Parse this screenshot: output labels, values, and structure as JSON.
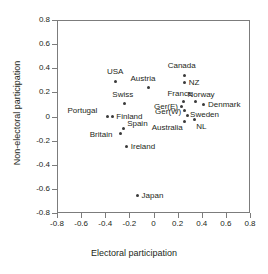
{
  "chart_data": {
    "type": "scatter",
    "title": "",
    "xlabel": "Electoral participation",
    "ylabel": "Non-electoral participation",
    "xlim": [
      -0.8,
      0.8
    ],
    "ylim": [
      -0.8,
      0.8
    ],
    "xticks": [
      "-0.8",
      "-0.6",
      "-0.4",
      "-0.2",
      "0",
      "0.2",
      "0.4",
      "0.6",
      "0.8"
    ],
    "xtick_values": [
      -0.8,
      -0.6,
      -0.4,
      -0.2,
      0,
      0.2,
      0.4,
      0.6,
      0.8
    ],
    "yticks": [
      "0.8",
      "0.6",
      "0.4",
      "0.2",
      "0",
      "-0.2",
      "-0.4",
      "-0.6",
      "-0.8"
    ],
    "ytick_values": [
      0.8,
      0.6,
      0.4,
      0.2,
      0,
      -0.2,
      -0.4,
      -0.6,
      -0.8
    ],
    "grid": false,
    "legend": false,
    "points": [
      {
        "label": "USA",
        "x": -0.32,
        "y": 0.3,
        "label_dx": -9,
        "label_dy": -13
      },
      {
        "label": "Canada",
        "x": 0.25,
        "y": 0.35,
        "label_dx": -17,
        "label_dy": -13
      },
      {
        "label": "NZ",
        "x": 0.25,
        "y": 0.29,
        "label_dx": 4,
        "label_dy": -4
      },
      {
        "label": "Austria",
        "x": -0.05,
        "y": 0.25,
        "label_dx": -18,
        "label_dy": -12
      },
      {
        "label": "Swiss",
        "x": -0.25,
        "y": 0.12,
        "label_dx": -12,
        "label_dy": -12
      },
      {
        "label": "France",
        "x": 0.24,
        "y": 0.13,
        "label_dx": -16,
        "label_dy": -12
      },
      {
        "label": "Norway",
        "x": 0.34,
        "y": 0.13,
        "label_dx": -8,
        "label_dy": -11
      },
      {
        "label": "Denmark",
        "x": 0.41,
        "y": 0.11,
        "label_dx": 4,
        "label_dy": -3
      },
      {
        "label": "Ger(E)",
        "x": 0.22,
        "y": 0.09,
        "label_dx": -27,
        "label_dy": -4
      },
      {
        "label": "Ger(W)",
        "x": 0.245,
        "y": 0.055,
        "label_dx": -29,
        "label_dy": -3
      },
      {
        "label": "Sweden",
        "x": 0.27,
        "y": 0.02,
        "label_dx": 3,
        "label_dy": -4
      },
      {
        "label": "Australia",
        "x": 0.25,
        "y": -0.03,
        "label_dx": -33,
        "label_dy": 3
      },
      {
        "label": "NL",
        "x": 0.33,
        "y": -0.02,
        "label_dx": 2,
        "label_dy": 3
      },
      {
        "label": "Portugal",
        "x": -0.39,
        "y": 0.01,
        "label_dx": -40,
        "label_dy": -9
      },
      {
        "label": "Finland",
        "x": -0.35,
        "y": 0.01,
        "label_dx": 4,
        "label_dy": -3
      },
      {
        "label": "Spain",
        "x": -0.26,
        "y": -0.09,
        "label_dx": 4,
        "label_dy": -8
      },
      {
        "label": "Britain",
        "x": -0.28,
        "y": -0.135,
        "label_dx": -31,
        "label_dy": -3
      },
      {
        "label": "Ireland",
        "x": -0.23,
        "y": -0.24,
        "label_dx": 4,
        "label_dy": -3
      },
      {
        "label": "Japan",
        "x": -0.14,
        "y": -0.645,
        "label_dx": 4,
        "label_dy": -3
      }
    ]
  }
}
